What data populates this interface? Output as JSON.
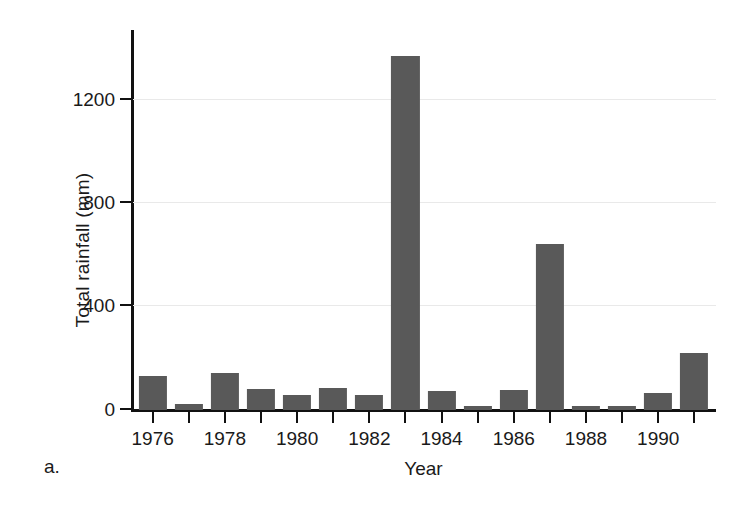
{
  "panel": {
    "label": "a."
  },
  "chart_data": {
    "type": "bar",
    "title": "",
    "subtitle": "",
    "xlabel": "Year",
    "ylabel": "Total rainfall (mm)",
    "categories": [
      1976,
      1977,
      1978,
      1979,
      1980,
      1981,
      1982,
      1983,
      1984,
      1985,
      1986,
      1987,
      1988,
      1989,
      1990,
      1991
    ],
    "values": [
      133,
      24,
      145,
      82,
      59,
      86,
      59,
      1370,
      75,
      16,
      78,
      643,
      16,
      16,
      67,
      220
    ],
    "xtick_values": [
      1976,
      1977,
      1978,
      1979,
      1980,
      1981,
      1982,
      1983,
      1984,
      1985,
      1986,
      1987,
      1988,
      1989,
      1990,
      1991
    ],
    "xtick_labels": [
      "1976",
      "",
      "1978",
      "",
      "1980",
      "",
      "1982",
      "",
      "1984",
      "",
      "1986",
      "",
      "1988",
      "",
      "1990",
      ""
    ],
    "ytick_values": [
      0,
      400,
      800,
      1200
    ],
    "ytick_labels": [
      "0",
      "400",
      "800",
      "1200"
    ],
    "xlim": [
      1975.4,
      1991.6
    ],
    "ylim": [
      0,
      1470
    ],
    "grid": true,
    "grid_axis": "y",
    "legend": false,
    "legend_position": "none",
    "bar_color": "#595959",
    "axis_color": "#111111",
    "grid_color": "#e9e9e9",
    "background_color": "#ffffff"
  }
}
